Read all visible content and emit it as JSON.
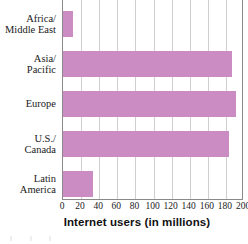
{
  "chart_data": {
    "type": "bar",
    "orientation": "horizontal",
    "title": "",
    "xlabel": "Internet users (in millions)",
    "ylabel": "",
    "categories": [
      "Africa/ Middle East",
      "Asia/ Pacific",
      "Europe",
      "U.S./ Canada",
      "Latin America"
    ],
    "category_lines": [
      [
        "Africa/",
        "Middle East"
      ],
      [
        "Asia/",
        "Pacific"
      ],
      [
        "Europe"
      ],
      [
        "U.S./",
        "Canada"
      ],
      [
        "Latin",
        "America"
      ]
    ],
    "values": [
      11,
      187,
      191,
      183,
      33
    ],
    "xlim": [
      0,
      200
    ],
    "xticks": [
      0,
      20,
      40,
      60,
      80,
      100,
      120,
      140,
      160,
      180,
      200
    ],
    "xtick_labels": [
      "0",
      "20",
      "40",
      "60",
      "80",
      "100",
      "120",
      "140",
      "160",
      "180",
      "200"
    ],
    "grid": "vertical",
    "legend": "none",
    "bar_color": "#cb8cc4",
    "axis_color": "#8a8a8a",
    "grid_color": "#cfcfcf"
  }
}
